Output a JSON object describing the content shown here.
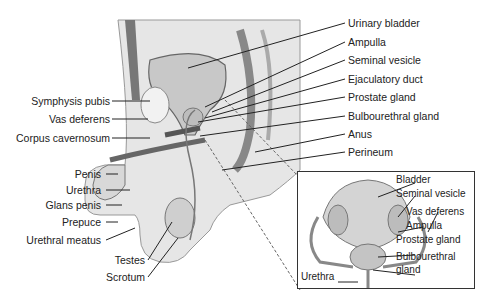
{
  "main_labels_right": [
    "Urinary bladder",
    "Ampulla",
    "Seminal vesicle",
    "Ejaculatory duct",
    "Prostate gland",
    "Bulbourethral gland",
    "Anus",
    "Perineum"
  ],
  "main_labels_left": [
    "Symphysis pubis",
    "Vas deferens",
    "Corpus cavernosum",
    "Penis",
    "Urethra",
    "Glans penis",
    "Prepuce",
    "Urethral meatus",
    "Testes",
    "Scrotum"
  ],
  "inset_labels": [
    "Bladder",
    "Seminal vesicle",
    "Vas deferens",
    "Ampulla",
    "Prostate gland",
    "Bulbourethral",
    "gland",
    "Urethra"
  ],
  "colors": {
    "tissue": "#e4e4e4",
    "dark_tissue": "#8a8a8a",
    "line": "#222222"
  }
}
